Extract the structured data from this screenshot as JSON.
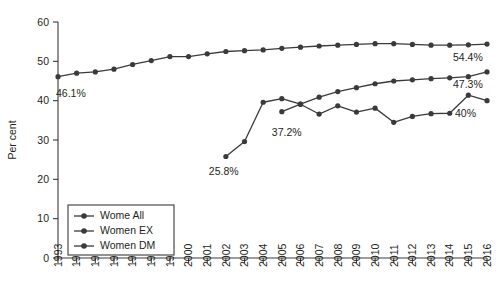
{
  "chart_data": {
    "type": "line",
    "title": "",
    "xlabel": "",
    "ylabel": "Per cent",
    "xlim": [
      1993,
      2016
    ],
    "ylim": [
      0,
      60
    ],
    "ytick_values": [
      0,
      10,
      20,
      30,
      40,
      50,
      60
    ],
    "ytick_labels": [
      "0",
      "10",
      "20",
      "30",
      "40",
      "50",
      "60"
    ],
    "grid": false,
    "legend_position": "lower-left",
    "x": [
      1993,
      1994,
      1995,
      1996,
      1997,
      1998,
      1999,
      2000,
      2001,
      2002,
      2003,
      2004,
      2005,
      2006,
      2007,
      2008,
      2009,
      2010,
      2011,
      2012,
      2013,
      2014,
      2015,
      2016
    ],
    "xtick_labels": [
      "1993",
      "1994",
      "1995",
      "1996",
      "1997",
      "1998",
      "1999",
      "2000",
      "2001",
      "2002",
      "2003",
      "2004",
      "2005",
      "2006",
      "2007",
      "2008",
      "2009",
      "2010",
      "2011",
      "2012",
      "2013",
      "2014",
      "2015",
      "2016"
    ],
    "series": [
      {
        "name": "Wome All",
        "marker": "circle",
        "color": "#3a3a3a",
        "x": [
          1993,
          1994,
          1995,
          1996,
          1997,
          1998,
          1999,
          2000,
          2001,
          2002,
          2003,
          2004,
          2005,
          2006,
          2007,
          2008,
          2009,
          2010,
          2011,
          2012,
          2013,
          2014,
          2015,
          2016
        ],
        "values": [
          46.1,
          47.0,
          47.3,
          48.0,
          49.2,
          50.2,
          51.2,
          51.2,
          51.9,
          52.5,
          52.7,
          52.9,
          53.3,
          53.6,
          53.9,
          54.1,
          54.3,
          54.5,
          54.5,
          54.3,
          54.1,
          54.1,
          54.2,
          54.4
        ]
      },
      {
        "name": "Women EX",
        "marker": "circle",
        "color": "#3a3a3a",
        "x": [
          2002,
          2003,
          2004,
          2005,
          2006,
          2007,
          2008,
          2009,
          2010,
          2011,
          2012,
          2013,
          2014,
          2015,
          2016
        ],
        "values": [
          25.8,
          29.6,
          39.6,
          40.5,
          39.1,
          40.9,
          42.3,
          43.3,
          44.3,
          45.0,
          45.3,
          45.6,
          45.8,
          46.1,
          47.3
        ]
      },
      {
        "name": "Women DM",
        "marker": "circle",
        "color": "#3a3a3a",
        "x": [
          2005,
          2006,
          2007,
          2008,
          2009,
          2010,
          2011,
          2012,
          2013,
          2014,
          2015,
          2016
        ],
        "values": [
          37.2,
          39.1,
          36.6,
          38.7,
          37.1,
          38.1,
          34.5,
          36.0,
          36.7,
          36.8,
          41.4,
          40.0
        ]
      }
    ],
    "annotations": [
      {
        "text": "46.1%",
        "x": 1993,
        "y": 46.1,
        "dx": -2,
        "dy": 20,
        "anchor": "start"
      },
      {
        "text": "54.4%",
        "x": 2016,
        "y": 54.4,
        "dx": -34,
        "dy": 17,
        "anchor": "start"
      },
      {
        "text": "25.8%",
        "x": 2002,
        "y": 25.8,
        "dx": -17,
        "dy": 18,
        "anchor": "start"
      },
      {
        "text": "37.2%",
        "x": 2005,
        "y": 37.2,
        "dx": -10,
        "dy": 24,
        "anchor": "start"
      },
      {
        "text": "47.3%",
        "x": 2016,
        "y": 47.3,
        "dx": -34,
        "dy": 16,
        "anchor": "start"
      },
      {
        "text": "40%",
        "x": 2016,
        "y": 40.0,
        "dx": -32,
        "dy": 16,
        "anchor": "start"
      }
    ],
    "legend_entries": [
      "Wome All",
      "Women EX",
      "Women DM"
    ]
  }
}
